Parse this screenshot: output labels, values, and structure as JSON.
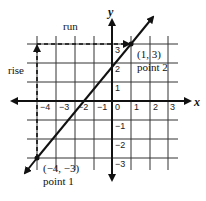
{
  "labels": {
    "run": "run",
    "rise": "rise",
    "x_axis": "x",
    "y_axis": "y",
    "point2_coords": "(1, 3)",
    "point2_name": "point 2",
    "point1_coords": "(−4, −3)",
    "point1_name": "point 1"
  },
  "ticks": {
    "x": [
      "−4",
      "−3",
      "−2",
      "−1",
      "0",
      "1",
      "2",
      "3"
    ],
    "y": [
      "3",
      "2",
      "1",
      "−1",
      "−2",
      "−3"
    ]
  },
  "points": [
    {
      "name": "point 1",
      "x": -4,
      "y": -3
    },
    {
      "name": "point 2",
      "x": 1,
      "y": 3
    }
  ],
  "colors": {
    "line": "#111111",
    "grid": "#333333",
    "background": "#ffffff"
  }
}
